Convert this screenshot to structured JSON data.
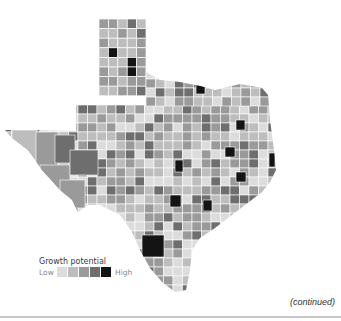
{
  "legend": {
    "title": "Growth potential",
    "low_label": "Low",
    "high_label": "High",
    "levels": [
      {
        "level": 1,
        "color": "#dcdcdc"
      },
      {
        "level": 2,
        "color": "#bdbdbd"
      },
      {
        "level": 3,
        "color": "#9a9a9a"
      },
      {
        "level": 4,
        "color": "#6e6e6e"
      },
      {
        "level": 5,
        "color": "#141414"
      }
    ]
  },
  "map": {
    "region": "Texas",
    "measure": "Growth potential by county",
    "panhandle_grid": [
      [
        3,
        3,
        2,
        4,
        2,
        0
      ],
      [
        2,
        2,
        3,
        2,
        4,
        0
      ],
      [
        3,
        2,
        2,
        2,
        3,
        0
      ],
      [
        2,
        5,
        2,
        2,
        3,
        0
      ],
      [
        2,
        2,
        2,
        5,
        3,
        0
      ],
      [
        3,
        2,
        3,
        5,
        3,
        0
      ],
      [
        3,
        3,
        2,
        3,
        3,
        0
      ],
      [
        2,
        2,
        3,
        3,
        4,
        0
      ]
    ],
    "high_counties_note": "Dark (level 5) counties appear in the panhandle, north-central, east, central and south Texas"
  },
  "footer": {
    "continued_label": "(continued)"
  }
}
